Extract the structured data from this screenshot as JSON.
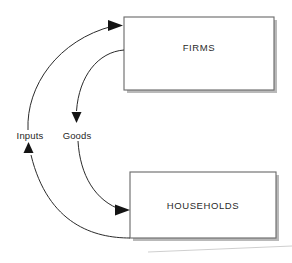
{
  "diagram": {
    "type": "circular-flow",
    "background_color": "#ffffff",
    "nodes": [
      {
        "id": "firms",
        "label": "FIRMS",
        "x": 124,
        "y": 17,
        "width": 150,
        "height": 73,
        "stroke_color": "#6e6e6e",
        "fill_color": "#ffffff"
      },
      {
        "id": "households",
        "label": "HOUSEHOLDS",
        "x": 130,
        "y": 172,
        "width": 146,
        "height": 66,
        "stroke_color": "#6e6e6e",
        "fill_color": "#ffffff"
      }
    ],
    "edges": [
      {
        "id": "inputs",
        "label": "Inputs",
        "from": "households",
        "to": "firms",
        "label_x": 30,
        "label_y": 136,
        "stroke_color": "#2b2b2b",
        "arrow_target": "firms-left-edge"
      },
      {
        "id": "goods",
        "label": "Goods",
        "from": "firms",
        "to": "households",
        "label_x": 77,
        "label_y": 136,
        "stroke_color": "#2b2b2b",
        "arrow_target": "households-left-edge"
      }
    ],
    "arrowheads": [
      {
        "id": "arrow-into-firms",
        "direction": "right",
        "x": 117,
        "y": 25
      },
      {
        "id": "arrow-goods-down",
        "direction": "down",
        "x": 76,
        "y": 119
      },
      {
        "id": "arrow-inputs-up",
        "direction": "up",
        "x": 28,
        "y": 144
      },
      {
        "id": "arrow-into-households",
        "direction": "right",
        "x": 124,
        "y": 210
      }
    ]
  }
}
